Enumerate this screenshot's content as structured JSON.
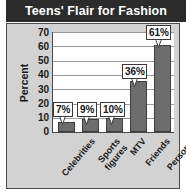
{
  "title": "Teens' Flair for Fashion",
  "colors": {
    "title_bar_bg": "#2b2b2b",
    "title_text": "#ffffff",
    "panel_bg": "#d2d2d2",
    "plot_bg": "#ffffff",
    "bar_fill": "#6d6d6d",
    "bar_border": "#3d3d3d",
    "gridline": "#9b9b9b",
    "axis_line": "#4a4a4a",
    "text": "#1a1a1a"
  },
  "chart_data": {
    "type": "bar",
    "title": "Teens' Flair for Fashion",
    "xlabel": "",
    "ylabel": "Percent",
    "ylim": [
      0,
      70
    ],
    "yticks": [
      0,
      10,
      20,
      30,
      40,
      50,
      60,
      70
    ],
    "ytick_labels": [
      "0",
      "10",
      "20",
      "30",
      "40",
      "50",
      "60",
      "70"
    ],
    "grid": true,
    "legend": "none",
    "categories": [
      "Celebrities",
      "Sports figures",
      "MTV",
      "Friends",
      "Personal style"
    ],
    "category_lines": [
      [
        "Celebrities"
      ],
      [
        "Sports",
        "figures"
      ],
      [
        "MTV"
      ],
      [
        "Friends"
      ],
      [
        "Personal",
        "style"
      ]
    ],
    "values": [
      7,
      9,
      10,
      36,
      61
    ],
    "data_labels": [
      "7%",
      "9%",
      "10%",
      "36%",
      "61%"
    ],
    "units": "percent"
  }
}
